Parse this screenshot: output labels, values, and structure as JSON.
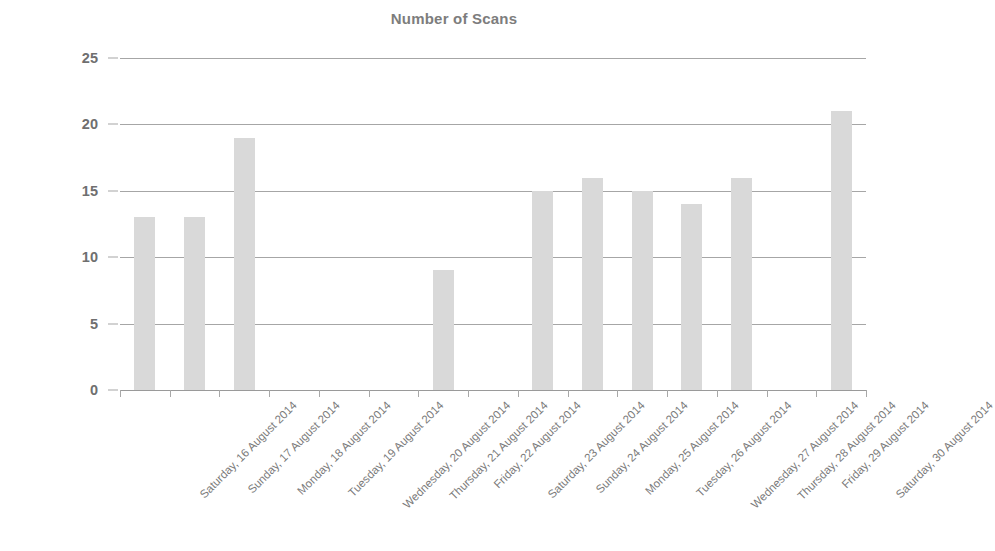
{
  "chart_data": {
    "type": "bar",
    "title": "Number of Scans",
    "xlabel": "",
    "ylabel": "",
    "ylim": [
      0,
      25
    ],
    "ytick_values": [
      0,
      5,
      10,
      15,
      20,
      25
    ],
    "ytick_labels": [
      "0",
      "5",
      "10",
      "15",
      "20",
      "25"
    ],
    "grid": true,
    "legend": "none",
    "bar_color": "#d9d9d9",
    "gridline_color": "#a6a6a6",
    "text_color": "#7a7a7a",
    "categories": [
      "Saturday, 16 August 2014",
      "Sunday, 17 August 2014",
      "Monday, 18 August 2014",
      "Tuesday, 19 August 2014",
      "Wednesday, 20 August 2014",
      "Thursday, 21 August 2014",
      "Friday, 22 August 2014",
      "Saturday, 23 August 2014",
      "Sunday, 24 August 2014",
      "Monday, 25 August 2014",
      "Tuesday, 26 August 2014",
      "Wednesday, 27 August 2014",
      "Thursday, 28 August 2014",
      "Friday, 29 August 2014",
      "Saturday, 30 August 2014"
    ],
    "values": [
      13,
      13,
      19,
      0,
      0,
      0,
      9,
      0,
      15,
      16,
      15,
      14,
      16,
      0,
      21
    ]
  }
}
